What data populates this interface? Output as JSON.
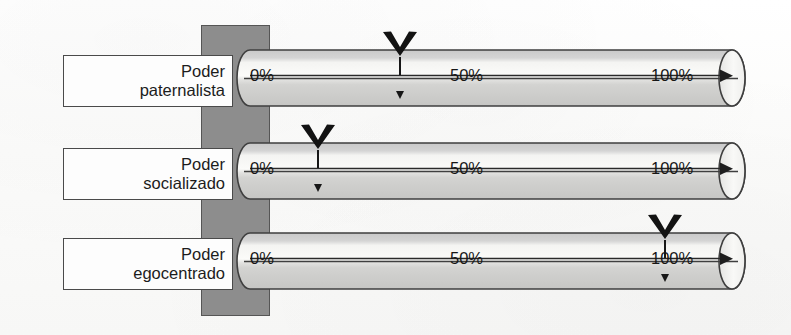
{
  "diagram": {
    "background_color": "#fdfdfc",
    "spine_color": "#8d8d8d",
    "ink_color": "#171717",
    "scale_ticks": [
      "0%",
      "50%",
      "100%"
    ],
    "rows": [
      {
        "id": "poder-paternalista",
        "label_line1": "Poder",
        "label_line2": "paternalista",
        "ticks": {
          "start": "0%",
          "middle": "50%",
          "end": "100%"
        },
        "marker_value": 33,
        "marker_label": "marcador-paternalista"
      },
      {
        "id": "poder-socializado",
        "label_line1": "Poder",
        "label_line2": "socializado",
        "ticks": {
          "start": "0%",
          "middle": "50%",
          "end": "100%"
        },
        "marker_value": 15,
        "marker_label": "marcador-socializado"
      },
      {
        "id": "poder-egocentrado",
        "label_line1": "Poder",
        "label_line2": "egocentrado",
        "ticks": {
          "start": "0%",
          "middle": "50%",
          "end": "100%"
        },
        "marker_value": 90,
        "marker_label": "marcador-egocentrado"
      }
    ]
  }
}
